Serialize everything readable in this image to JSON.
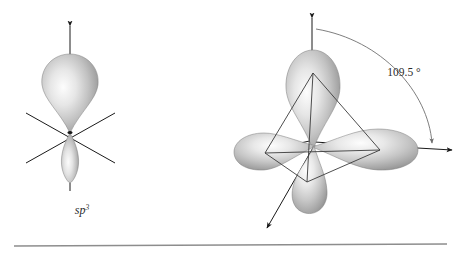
{
  "figure": {
    "background_color": "#ffffff",
    "stroke_color": "#1a1a1a",
    "arc_color": "#777777",
    "rule_color": "#8d8d8d",
    "lobe_light": "#fbfbfb",
    "lobe_mid": "#c9c9c9",
    "lobe_dark": "#8f8f8f",
    "lobe_edge": "#6e6e6e"
  },
  "left_panel": {
    "name": "single sp3 hybrid orbital",
    "label": "sp",
    "label_superscript": "3",
    "label_full": "sp3",
    "lobes": [
      {
        "name": "major-lobe",
        "direction": "up",
        "size": "large"
      },
      {
        "name": "minor-lobe",
        "direction": "down",
        "size": "small"
      }
    ],
    "axes": [
      {
        "name": "vertical-axis-arrow",
        "direction": "up",
        "arrowhead": true
      },
      {
        "name": "diagonal-axis-left",
        "direction": "upper-left to lower-right",
        "arrowhead": false
      },
      {
        "name": "diagonal-axis-right",
        "direction": "upper-right to lower-left",
        "arrowhead": false
      },
      {
        "name": "vertical-stem-down",
        "direction": "down",
        "arrowhead": false
      }
    ]
  },
  "right_panel": {
    "name": "four sp3 hybrid orbitals in tetrahedral arrangement",
    "angle_label": "109.5 °",
    "angle_value": 109.5,
    "angle_units": "degrees",
    "lobes": [
      {
        "name": "lobe-top",
        "direction": "up"
      },
      {
        "name": "lobe-left",
        "direction": "left"
      },
      {
        "name": "lobe-right",
        "direction": "right"
      },
      {
        "name": "lobe-front-bottom",
        "direction": "down-left front"
      }
    ],
    "axis_arrows": [
      {
        "name": "axis-arrow-up",
        "direction": "up"
      },
      {
        "name": "axis-arrow-left",
        "direction": "left"
      },
      {
        "name": "axis-arrow-right",
        "direction": "right"
      },
      {
        "name": "axis-arrow-down-left",
        "direction": "down-left"
      }
    ],
    "wireframe": {
      "name": "tetrahedron-wireframe",
      "shape": "tetrahedron",
      "edges": 6,
      "vertices": 4
    },
    "angle_arc": {
      "name": "angle-arc",
      "from": "axis-arrow-up",
      "to": "axis-arrow-right",
      "arrowheads": "both-ends"
    }
  },
  "footer_rule": {
    "name": "horizontal-rule",
    "visible": true
  }
}
